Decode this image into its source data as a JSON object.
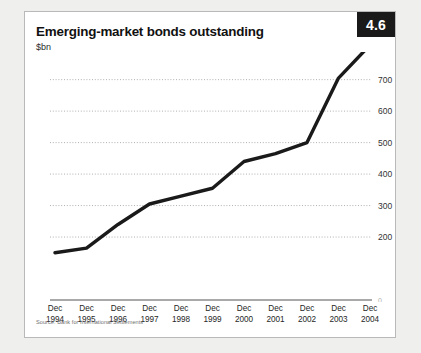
{
  "card": {
    "title": "Emerging-market bonds outstanding",
    "subtitle": "$bn",
    "badge": "4.6",
    "source": "Source: Bank for International Settlements"
  },
  "colors": {
    "page_background": "#efefee",
    "card_background": "#ffffff",
    "card_border": "#b9b9b9",
    "badge_background": "#1a1a1a",
    "badge_text": "#ffffff",
    "line": "#1a1a1a",
    "gridline": "#a8a8a8",
    "axis": "#555555",
    "title_text": "#111111",
    "tick_text": "#333333"
  },
  "chart_data": {
    "type": "line",
    "title": "Emerging-market bonds outstanding",
    "subtitle": "$bn",
    "xlabel": "",
    "ylabel": "$bn",
    "categories": [
      "Dec 1994",
      "Dec 1995",
      "Dec 1996",
      "Dec 1997",
      "Dec 1998",
      "Dec 1999",
      "Dec 2000",
      "Dec 2001",
      "Dec 2002",
      "Dec 2003",
      "Dec 2004"
    ],
    "category_lines": [
      [
        "Dec",
        "1994"
      ],
      [
        "Dec",
        "1995"
      ],
      [
        "Dec",
        "1996"
      ],
      [
        "Dec",
        "1997"
      ],
      [
        "Dec",
        "1998"
      ],
      [
        "Dec",
        "1999"
      ],
      [
        "Dec",
        "2000"
      ],
      [
        "Dec",
        "2001"
      ],
      [
        "Dec",
        "2002"
      ],
      [
        "Dec",
        "2003"
      ],
      [
        "Dec",
        "2004"
      ]
    ],
    "values": [
      150,
      165,
      240,
      305,
      330,
      355,
      440,
      465,
      500,
      705,
      810
    ],
    "ylim": [
      0,
      850
    ],
    "yticks": [
      0,
      200,
      300,
      400,
      500,
      600,
      700,
      800
    ],
    "ytick_labels": [
      "0",
      "200",
      "300",
      "400",
      "500",
      "600",
      "700",
      "800"
    ],
    "grid": true,
    "grid_style": "dotted-horizontal",
    "legend": "none",
    "series": [
      {
        "name": "Emerging-market bonds outstanding",
        "values": [
          150,
          165,
          240,
          305,
          330,
          355,
          440,
          465,
          500,
          705,
          810
        ]
      }
    ]
  }
}
